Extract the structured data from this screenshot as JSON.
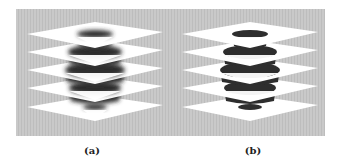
{
  "figure": {
    "background_color": "#c8c8c8",
    "plane_color": "#ffffff",
    "object_color": "#2e2e2e",
    "panel": {
      "x": 16,
      "y": 9,
      "width": 309,
      "height": 127
    }
  },
  "subfigures": [
    {
      "label": "(a)",
      "center_x": 95,
      "description": "sliced sphere with blurred slices between stacked planes",
      "style": "blurred"
    },
    {
      "label": "(b)",
      "center_x": 250,
      "description": "sliced sphere with sharp slices between stacked planes",
      "style": "sharp"
    }
  ],
  "layers": [
    {
      "y": 20,
      "slice_rx": 18,
      "slice_ry": 4
    },
    {
      "y": 38,
      "slice_rx": 27,
      "slice_ry": 7
    },
    {
      "y": 56,
      "slice_rx": 30,
      "slice_ry": 8
    },
    {
      "y": 74,
      "slice_rx": 26,
      "slice_ry": 7
    },
    {
      "y": 93,
      "slice_rx": 12,
      "slice_ry": 3
    }
  ]
}
